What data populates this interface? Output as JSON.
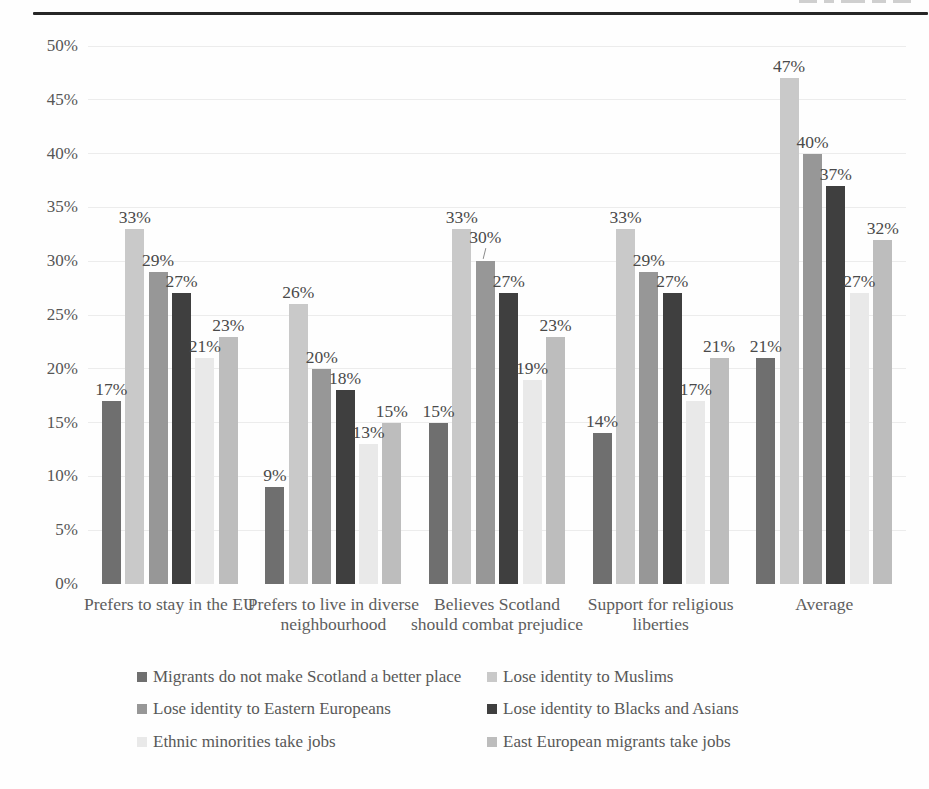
{
  "chart_data": {
    "type": "bar",
    "title": "",
    "xlabel": "",
    "ylabel": "",
    "ylim": [
      0,
      50
    ],
    "ytick_step": 5,
    "yticks": [
      "0%",
      "5%",
      "10%",
      "15%",
      "20%",
      "25%",
      "30%",
      "35%",
      "40%",
      "45%",
      "50%"
    ],
    "grid": true,
    "legend_position": "bottom",
    "value_label_suffix": "%",
    "categories": [
      "Prefers to stay in the EU",
      "Prefers to live in diverse neighbourhood",
      "Believes Scotland should combat prejudice",
      "Support for religious liberties",
      "Average"
    ],
    "series": [
      {
        "name": "Migrants do not make Scotland a better place",
        "color": "#6f6f6f",
        "values": [
          17,
          9,
          15,
          14,
          21
        ]
      },
      {
        "name": "Lose identity to Muslims",
        "color": "#c9c9c9",
        "values": [
          33,
          26,
          33,
          33,
          47
        ]
      },
      {
        "name": "Lose identity to Eastern Europeans",
        "color": "#979797",
        "values": [
          29,
          20,
          30,
          29,
          40
        ]
      },
      {
        "name": "Lose identity to Blacks and Asians",
        "color": "#3f3f3f",
        "values": [
          27,
          18,
          27,
          27,
          37
        ]
      },
      {
        "name": "Ethnic minorities take jobs",
        "color": "#e9e9e9",
        "values": [
          21,
          13,
          19,
          17,
          27
        ]
      },
      {
        "name": "East European migrants take jobs",
        "color": "#bdbdbd",
        "values": [
          23,
          15,
          23,
          21,
          32
        ]
      }
    ],
    "label_leaders": [
      {
        "category_index": 2,
        "series_index": 2
      }
    ]
  }
}
